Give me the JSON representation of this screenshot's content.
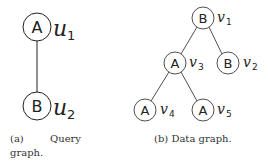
{
  "query_graph": {
    "nodes": [
      {
        "id": "u1",
        "label": "A",
        "name": "u",
        "sub": "1"
      },
      {
        "id": "u2",
        "label": "B",
        "name": "u",
        "sub": "2"
      }
    ],
    "edges": [
      [
        "u1",
        "u2"
      ]
    ],
    "caption_a": "(a)",
    "caption_word": "Query",
    "caption_line2": "graph."
  },
  "data_graph": {
    "nodes": [
      {
        "id": "v1",
        "label": "B",
        "name": "v",
        "sub": "1"
      },
      {
        "id": "v2",
        "label": "B",
        "name": "v",
        "sub": "2"
      },
      {
        "id": "v3",
        "label": "A",
        "name": "v",
        "sub": "3"
      },
      {
        "id": "v4",
        "label": "A",
        "name": "v",
        "sub": "4"
      },
      {
        "id": "v5",
        "label": "A",
        "name": "v",
        "sub": "5"
      }
    ],
    "edges": [
      [
        "v1",
        "v3"
      ],
      [
        "v1",
        "v2"
      ],
      [
        "v3",
        "v4"
      ],
      [
        "v3",
        "v5"
      ]
    ],
    "caption": "(b) Data graph."
  }
}
